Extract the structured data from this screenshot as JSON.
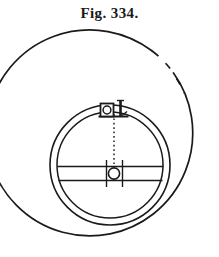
{
  "figure": {
    "caption": "Fig. 334.",
    "caption_position": "top-center",
    "background_color": "#ffffff",
    "ink_color": "#1a1a1a",
    "style": "antique line engraving, black ink on white"
  },
  "canvas": {
    "width": 219,
    "height": 257
  },
  "geometry": {
    "outer_circle": {
      "name": "outer-rim",
      "center_x": 93,
      "center_y": 138,
      "radius": 103,
      "stroke_width": 1.6,
      "dashed_upper_right": true,
      "dash_pattern": "28 9 16 8 40 7"
    },
    "inner_ring_outer": {
      "name": "inner-ring-outer-edge",
      "center_x": 110,
      "center_y": 165,
      "radius": 60,
      "stroke_width": 1.5
    },
    "inner_ring_inner": {
      "name": "inner-ring-inner-edge",
      "center_x": 110,
      "center_y": 165,
      "radius": 53,
      "stroke_width": 1.4
    },
    "cross_bar": {
      "name": "horizontal-cross-bar",
      "top_y": 166,
      "bottom_y": 180,
      "left_x": 57,
      "right_x": 164,
      "stroke_width": 1.4
    },
    "center_hub": {
      "name": "center-hub",
      "center_x": 114,
      "center_y": 173,
      "circle_radius": 5.5,
      "left_flange_x": 106,
      "right_flange_x": 123,
      "flange_top_y": 160,
      "flange_bottom_y": 187,
      "stroke_width": 1.4
    },
    "top_lug": {
      "name": "top-lug-fitting",
      "box_left_x": 101,
      "box_right_x": 113,
      "box_top_y": 104,
      "box_bottom_y": 116,
      "eye_center_x": 107,
      "eye_center_y": 110,
      "eye_radius": 4,
      "pin_x": 120,
      "pin_top_y": 100,
      "pin_bottom_y": 116,
      "pin_width": 3,
      "base_left_x": 99,
      "base_right_x": 128,
      "stroke_width": 1.5
    },
    "center_dotted_line": {
      "name": "vertical-center-dotted-line",
      "x": 114,
      "top_y": 114,
      "bottom_y": 168,
      "dash_pattern": "1.6 2.6",
      "stroke_width": 1.3
    }
  },
  "labels": {
    "outer_rim": "outer rim",
    "inner_ring": "inner ring band",
    "cross_bar": "cross bar",
    "center_hub": "center hub",
    "top_lug": "top lug fitting",
    "center_line": "center line"
  }
}
